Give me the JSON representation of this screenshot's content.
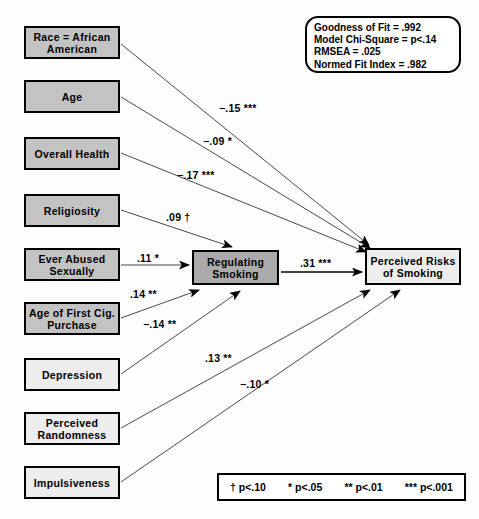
{
  "diagram": {
    "type": "path-diagram",
    "background_color": "#fdfdfd"
  },
  "predictors": [
    {
      "id": "race",
      "label": "Race = African American",
      "fill": "#c3c3c3",
      "x": 24,
      "y": 26,
      "w": 96,
      "h": 33
    },
    {
      "id": "age",
      "label": "Age",
      "fill": "#c3c3c3",
      "x": 24,
      "y": 80,
      "w": 96,
      "h": 33
    },
    {
      "id": "overall_health",
      "label": "Overall Health",
      "fill": "#c3c3c3",
      "x": 24,
      "y": 137,
      "w": 96,
      "h": 33
    },
    {
      "id": "religiosity",
      "label": "Religiosity",
      "fill": "#c3c3c3",
      "x": 24,
      "y": 194,
      "w": 96,
      "h": 33
    },
    {
      "id": "ever_abused",
      "label": "Ever Abused Sexually",
      "fill": "#c3c3c3",
      "x": 24,
      "y": 248,
      "w": 96,
      "h": 33
    },
    {
      "id": "age_first_cig",
      "label": "Age of First Cig. Purchase",
      "fill": "#c3c3c3",
      "x": 24,
      "y": 302,
      "w": 96,
      "h": 33
    },
    {
      "id": "depression",
      "label": "Depression",
      "fill": "#ededed",
      "x": 24,
      "y": 358,
      "w": 96,
      "h": 33
    },
    {
      "id": "perceived_randomness",
      "label": "Perceived Randomness",
      "fill": "#ededed",
      "x": 24,
      "y": 412,
      "w": 96,
      "h": 33
    },
    {
      "id": "impulsiveness",
      "label": "Impulsiveness",
      "fill": "#ededed",
      "x": 24,
      "y": 466,
      "w": 96,
      "h": 33
    }
  ],
  "mediator": {
    "id": "regulating_smoking",
    "label": "Regulating Smoking",
    "fill": "#ababab",
    "x": 192,
    "y": 250,
    "w": 87,
    "h": 35
  },
  "outcome": {
    "id": "perceived_risks",
    "label": "Perceived Risks of Smoking",
    "fill": "#ededed",
    "x": 365,
    "y": 248,
    "w": 96,
    "h": 37
  },
  "paths": [
    {
      "from": "race",
      "to": "perceived_risks",
      "coefficient": "−.15 ***",
      "label_x": 219,
      "label_y": 102
    },
    {
      "from": "age",
      "to": "perceived_risks",
      "coefficient": "−.09 *",
      "label_x": 203,
      "label_y": 135
    },
    {
      "from": "overall_health",
      "to": "perceived_risks",
      "coefficient": "−.17 ***",
      "label_x": 177,
      "label_y": 169
    },
    {
      "from": "religiosity",
      "to": "regulating_smoking",
      "coefficient": ".09 †",
      "label_x": 166,
      "label_y": 211
    },
    {
      "from": "ever_abused",
      "to": "regulating_smoking",
      "coefficient": ".11 *",
      "label_x": 137,
      "label_y": 252
    },
    {
      "from": "age_first_cig",
      "to": "regulating_smoking",
      "coefficient": ".14 **",
      "label_x": 130,
      "label_y": 288
    },
    {
      "from": "depression",
      "to": "regulating_smoking",
      "coefficient": "−.14 **",
      "label_x": 143,
      "label_y": 318
    },
    {
      "from": "perceived_randomness",
      "to": "perceived_risks",
      "coefficient": ".13 **",
      "label_x": 205,
      "label_y": 352
    },
    {
      "from": "impulsiveness",
      "to": "perceived_risks",
      "coefficient": "−.10 *",
      "label_x": 240,
      "label_y": 378
    },
    {
      "from": "regulating_smoking",
      "to": "perceived_risks",
      "coefficient": ".31 ***",
      "label_x": 300,
      "label_y": 257
    }
  ],
  "fit_statistics": {
    "goodness_of_fit": "Goodness of Fit = .992",
    "model_chi_square": "Model Chi-Square = p<.14",
    "rmsea": "RMSEA = .025",
    "normed_fit_index": "Normed Fit Index = .982"
  },
  "significance_legend": {
    "dagger": "† p<.10",
    "one_star": "* p<.05",
    "two_star": "** p<.01",
    "three_star": "*** p<.001"
  }
}
